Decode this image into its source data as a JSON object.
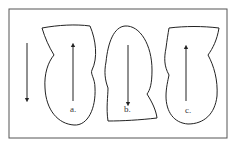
{
  "diagram": {
    "colors": {
      "background": "#ffffff",
      "stroke": "#222222",
      "frame": "#555555",
      "label": "#333333"
    },
    "frame": {
      "x": 9,
      "y": 9,
      "width": 218,
      "height": 129
    },
    "reference_arrow": {
      "x": 27,
      "y1": 43,
      "y2": 100,
      "direction": "down"
    },
    "figures": [
      {
        "id": "a",
        "label": "a.",
        "label_pos": {
          "x": 70,
          "y": 105
        },
        "arrow": {
          "x": 73,
          "y1": 101,
          "y2": 45,
          "direction": "up"
        },
        "outline": "M42,28 C58,25 76,24 90,26 C96,40 98,58 92,70 C90,74 95,78 95,88 C96,108 88,126 74,125 C58,124 46,110 45,88 C44,74 48,62 54,55 C49,47 45,38 42,28 Z"
      },
      {
        "id": "b",
        "label": "b.",
        "label_pos": {
          "x": 124,
          "y": 105
        },
        "arrow": {
          "x": 128,
          "y1": 45,
          "y2": 104,
          "direction": "down"
        },
        "outline": "M125,26 C140,25 152,45 152,70 C152,84 150,90 147,94 C152,102 156,110 157,118 C140,120 122,121 108,121 C106,108 108,96 108,88 C105,80 104,72 106,62 C108,42 114,27 125,26 Z"
      },
      {
        "id": "c",
        "label": "c.",
        "label_pos": {
          "x": 185,
          "y": 106
        },
        "arrow": {
          "x": 186,
          "y1": 101,
          "y2": 47,
          "direction": "up"
        },
        "outline": "M169,28 C185,26 203,26 219,28 C217,40 213,48 208,55 C214,66 218,80 217,96 C215,114 204,124 188,124 C174,123 166,112 166,96 C166,88 168,80 169,75 C164,66 164,58 166,48 C167,40 168,34 169,28 Z"
      }
    ]
  }
}
